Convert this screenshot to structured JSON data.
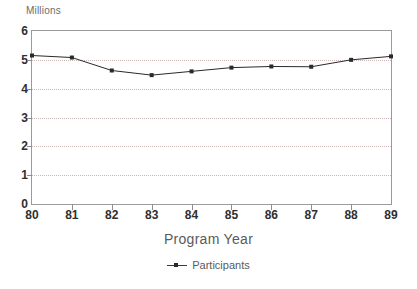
{
  "chart_data": {
    "type": "line",
    "title": "",
    "subtitle": "",
    "unit_label": "Millions",
    "xlabel": "Program Year",
    "ylabel": "",
    "categories": [
      "80",
      "81",
      "82",
      "83",
      "84",
      "85",
      "86",
      "87",
      "88",
      "89"
    ],
    "x": [
      80,
      81,
      82,
      83,
      84,
      85,
      86,
      87,
      88,
      89
    ],
    "series": [
      {
        "name": "Participants",
        "values": [
          5.15,
          5.08,
          4.63,
          4.47,
          4.6,
          4.73,
          4.77,
          4.76,
          5.0,
          5.12
        ],
        "color": "#2a2a2a",
        "marker": "square"
      }
    ],
    "ylim": [
      0,
      6
    ],
    "yticks": [
      0,
      1,
      2,
      3,
      4,
      5,
      6
    ],
    "ytick_labels": [
      "0",
      "1",
      "2",
      "3",
      "4",
      "5",
      "6"
    ],
    "xlim": [
      80,
      89
    ],
    "xtick_labels": [
      "80",
      "81",
      "82",
      "83",
      "84",
      "85",
      "86",
      "87",
      "88",
      "89"
    ],
    "grid": true,
    "grid_axis": "y",
    "grid_style": "dotted",
    "grid_color": "#c9b6b6",
    "legend_position": "bottom",
    "legend_entries": [
      "Participants"
    ],
    "frame_color": "#9a9a9a",
    "background": "#ffffff",
    "annotations": []
  },
  "legend": {
    "marker_icon": "line-marker-icon"
  }
}
